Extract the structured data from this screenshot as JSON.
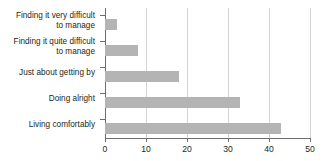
{
  "chart_data": {
    "type": "bar",
    "orientation": "horizontal",
    "title": "",
    "subtitle": "",
    "xlabel": "",
    "ylabel": "",
    "categories": [
      "Finding it very difficult to manage",
      "Finding it quite difficult to manage",
      "Just about getting by",
      "Doing alright",
      "Living comfortably"
    ],
    "category_lines": [
      [
        "Finding it very difficult",
        "to manage"
      ],
      [
        "Finding it quite difficult",
        "to manage"
      ],
      [
        "Just about getting by"
      ],
      [
        "Doing alright"
      ],
      [
        "Living comfortably"
      ]
    ],
    "values": [
      3,
      8,
      18,
      33,
      43
    ],
    "xlim": [
      0,
      50
    ],
    "xticks": [
      0,
      10,
      20,
      30,
      40,
      50
    ],
    "xtick_labels": [
      "0",
      "10",
      "20",
      "30",
      "40",
      "50"
    ],
    "grid": true,
    "grid_axis": "x",
    "legend": false,
    "bar_color": "#b4b4b4",
    "gridline_color": "#d4d4d4",
    "axis_color": "#6e6e6e",
    "text_color": "#231f20",
    "background_color": "#ffffff"
  }
}
